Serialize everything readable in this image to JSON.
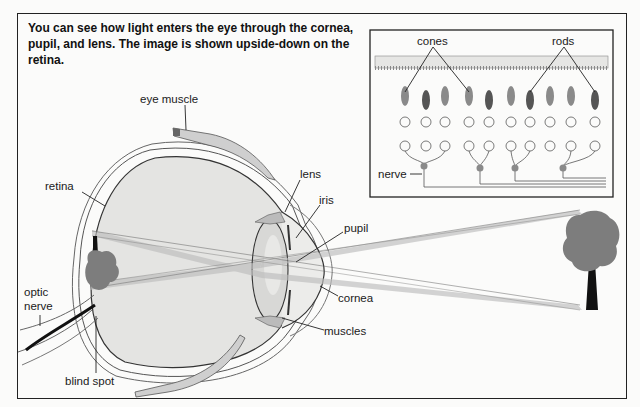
{
  "caption": "You can see how light enters the eye through the cornea, pupil, and lens. The image is shown upside-down on the retina.",
  "eye_labels": {
    "eye_muscle": "eye muscle",
    "retina": "retina",
    "lens": "lens",
    "iris": "iris",
    "pupil": "pupil",
    "cornea": "cornea",
    "muscles": "muscles",
    "optic_nerve_line1": "optic",
    "optic_nerve_line2": "nerve",
    "blind_spot": "blind spot"
  },
  "inset_labels": {
    "cones": "cones",
    "rods": "rods",
    "nerve": "nerve"
  },
  "colors": {
    "frame": "#222222",
    "eyeball_fill": "#e4e4e2",
    "light_ray": "#bdbdbd",
    "tree": "#7d7d7d",
    "background": "#fbfbfa"
  }
}
